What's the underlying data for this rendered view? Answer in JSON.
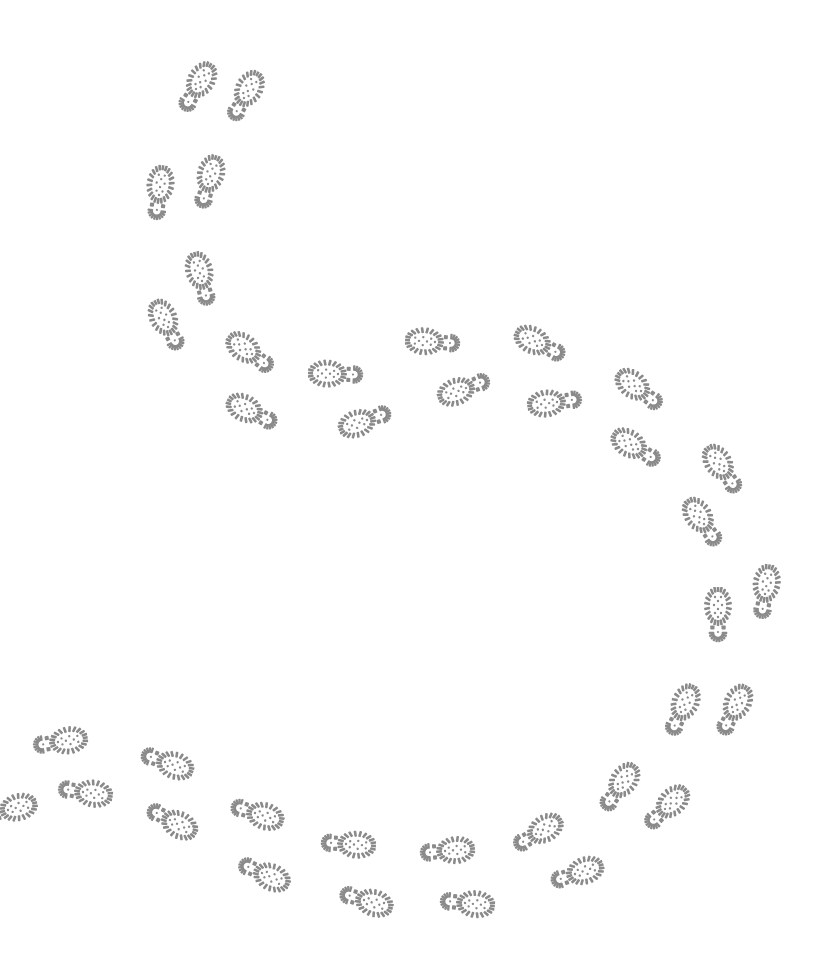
{
  "scene": {
    "title": "Boot footprints trail",
    "background_color": "#ffffff",
    "print_color": "#8a8a8a",
    "description": "Winding trail of boot footprints on a white background"
  },
  "footprints": [
    {
      "x": 196,
      "y": 89,
      "angle": 31
    },
    {
      "x": 244,
      "y": 98,
      "angle": 29
    },
    {
      "x": 159,
      "y": 195,
      "angle": 8
    },
    {
      "x": 208,
      "y": 184,
      "angle": 16
    },
    {
      "x": 202,
      "y": 281,
      "angle": -15
    },
    {
      "x": 168,
      "y": 327,
      "angle": -27
    },
    {
      "x": 252,
      "y": 354,
      "angle": -53
    },
    {
      "x": 254,
      "y": 413,
      "angle": -63
    },
    {
      "x": 338,
      "y": 374,
      "angle": -88
    },
    {
      "x": 367,
      "y": 420,
      "angle": -110
    },
    {
      "x": 435,
      "y": 342,
      "angle": -86
    },
    {
      "x": 466,
      "y": 388,
      "angle": -111
    },
    {
      "x": 542,
      "y": 345,
      "angle": -63
    },
    {
      "x": 557,
      "y": 402,
      "angle": -98
    },
    {
      "x": 641,
      "y": 391,
      "angle": -52
    },
    {
      "x": 638,
      "y": 449,
      "angle": -58
    },
    {
      "x": 724,
      "y": 471,
      "angle": -34
    },
    {
      "x": 704,
      "y": 524,
      "angle": -34
    },
    {
      "x": 718,
      "y": 617,
      "angle": 0
    },
    {
      "x": 765,
      "y": 594,
      "angle": 9
    },
    {
      "x": 681,
      "y": 712,
      "angle": 25
    },
    {
      "x": 733,
      "y": 712,
      "angle": 27
    },
    {
      "x": 618,
      "y": 789,
      "angle": 35
    },
    {
      "x": 665,
      "y": 809,
      "angle": 46
    },
    {
      "x": 575,
      "y": 874,
      "angle": 71
    },
    {
      "x": 536,
      "y": 834,
      "angle": 59
    },
    {
      "x": 445,
      "y": 851,
      "angle": 85
    },
    {
      "x": 465,
      "y": 903,
      "angle": 96
    },
    {
      "x": 346,
      "y": 844,
      "angle": 94
    },
    {
      "x": 364,
      "y": 900,
      "angle": 107
    },
    {
      "x": 255,
      "y": 813,
      "angle": 108
    },
    {
      "x": 262,
      "y": 873,
      "angle": 114
    },
    {
      "x": 170,
      "y": 820,
      "angle": 118
    },
    {
      "x": 165,
      "y": 762,
      "angle": 110
    },
    {
      "x": 83,
      "y": 792,
      "angle": 99
    },
    {
      "x": 58,
      "y": 742,
      "angle": 81
    },
    {
      "x": 8,
      "y": 810,
      "angle": 75
    }
  ]
}
